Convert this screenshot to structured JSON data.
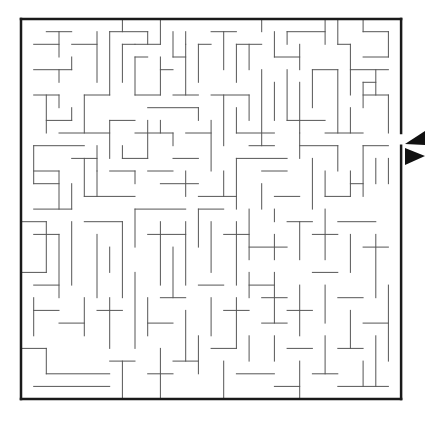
{
  "puzzle": {
    "type": "maze",
    "title": "Maze puzzle",
    "grid": {
      "cols": 30,
      "rows": 30,
      "origin_x": 21,
      "origin_y": 19,
      "cell": 12.67
    },
    "colors": {
      "wall": "#555555",
      "border": "#1a1a1a",
      "background": "#ffffff",
      "arrow": "#111111"
    },
    "entrance": {
      "side": "right",
      "row": 9,
      "label": "Entrance"
    },
    "arrow": {
      "direction": "left",
      "x": 404,
      "y": 131,
      "label": "Start here"
    },
    "border_segments": [
      [
        0,
        0,
        30,
        0
      ],
      [
        0,
        0,
        0,
        30
      ],
      [
        0,
        30,
        30,
        30
      ],
      [
        30,
        0,
        30,
        9
      ],
      [
        30,
        10,
        30,
        30
      ]
    ],
    "walls": [
      [
        8,
        0,
        8,
        1
      ],
      [
        19,
        0,
        19,
        1
      ],
      [
        27,
        0,
        27,
        1
      ],
      [
        25,
        0,
        25,
        2
      ],
      [
        24,
        0,
        24,
        2
      ],
      [
        2,
        1,
        4,
        1
      ],
      [
        1,
        2,
        3,
        2
      ],
      [
        3,
        1,
        3,
        3
      ],
      [
        1,
        4,
        4,
        4
      ],
      [
        4,
        3,
        4,
        4
      ],
      [
        3,
        4,
        3,
        5
      ],
      [
        6,
        1,
        6,
        5
      ],
      [
        4,
        2,
        6,
        2
      ],
      [
        7,
        1,
        7,
        6
      ],
      [
        7,
        1,
        10,
        1
      ],
      [
        10,
        1,
        10,
        2
      ],
      [
        9,
        2,
        11,
        2
      ],
      [
        11,
        0,
        11,
        2
      ],
      [
        8,
        2,
        8,
        5
      ],
      [
        8,
        2,
        9,
        2
      ],
      [
        9,
        3,
        10,
        3
      ],
      [
        9,
        3,
        9,
        6
      ],
      [
        9,
        6,
        11,
        6
      ],
      [
        12,
        1,
        12,
        3
      ],
      [
        12,
        3,
        13,
        3
      ],
      [
        13,
        1,
        13,
        2
      ],
      [
        11,
        3,
        11,
        6
      ],
      [
        11,
        4,
        12,
        4
      ],
      [
        13,
        2,
        13,
        6
      ],
      [
        12,
        6,
        14,
        6
      ],
      [
        14,
        2,
        14,
        5
      ],
      [
        14,
        2,
        15,
        2
      ],
      [
        15,
        1,
        17,
        1
      ],
      [
        16,
        1,
        16,
        4
      ],
      [
        17,
        2,
        19,
        2
      ],
      [
        17,
        2,
        17,
        5
      ],
      [
        18,
        2,
        18,
        4
      ],
      [
        20,
        1,
        20,
        3
      ],
      [
        20,
        3,
        22,
        3
      ],
      [
        22,
        2,
        22,
        4
      ],
      [
        21,
        1,
        24,
        1
      ],
      [
        21,
        1,
        21,
        2
      ],
      [
        25,
        2,
        26,
        2
      ],
      [
        26,
        2,
        26,
        6
      ],
      [
        27,
        1,
        29,
        1
      ],
      [
        29,
        1,
        29,
        3
      ],
      [
        27,
        3,
        29,
        3
      ],
      [
        26,
        4,
        29,
        4
      ],
      [
        28,
        4,
        28,
        6
      ],
      [
        27,
        5,
        28,
        5
      ],
      [
        27,
        5,
        27,
        7
      ],
      [
        27,
        6,
        29,
        6
      ],
      [
        29,
        6,
        29,
        9
      ],
      [
        1,
        6,
        3,
        6
      ],
      [
        3,
        6,
        3,
        7
      ],
      [
        2,
        6,
        2,
        9
      ],
      [
        2,
        8,
        4,
        8
      ],
      [
        4,
        7,
        4,
        8
      ],
      [
        5,
        6,
        5,
        9
      ],
      [
        5,
        6,
        7,
        6
      ],
      [
        3,
        9,
        7,
        9
      ],
      [
        1,
        10,
        5,
        10
      ],
      [
        1,
        10,
        1,
        13
      ],
      [
        1,
        12,
        3,
        12
      ],
      [
        3,
        12,
        3,
        15
      ],
      [
        4,
        11,
        6,
        11
      ],
      [
        5,
        11,
        5,
        14
      ],
      [
        6,
        10,
        6,
        12
      ],
      [
        7,
        8,
        7,
        11
      ],
      [
        7,
        8,
        9,
        8
      ],
      [
        8,
        10,
        8,
        11
      ],
      [
        8,
        11,
        10,
        11
      ],
      [
        10,
        8,
        10,
        11
      ],
      [
        9,
        9,
        12,
        9
      ],
      [
        12,
        9,
        12,
        10
      ],
      [
        10,
        7,
        14,
        7
      ],
      [
        14,
        7,
        14,
        8
      ],
      [
        11,
        8,
        11,
        9
      ],
      [
        13,
        9,
        15,
        9
      ],
      [
        15,
        8,
        15,
        12
      ],
      [
        16,
        6,
        16,
        10
      ],
      [
        15,
        6,
        18,
        6
      ],
      [
        18,
        6,
        18,
        8
      ],
      [
        17,
        7,
        17,
        9
      ],
      [
        17,
        9,
        20,
        9
      ],
      [
        18,
        10,
        20,
        10
      ],
      [
        19,
        4,
        19,
        10
      ],
      [
        20,
        5,
        20,
        8
      ],
      [
        21,
        4,
        21,
        8
      ],
      [
        22,
        5,
        22,
        9
      ],
      [
        21,
        8,
        24,
        8
      ],
      [
        23,
        4,
        23,
        7
      ],
      [
        23,
        4,
        25,
        4
      ],
      [
        25,
        4,
        25,
        9
      ],
      [
        24,
        9,
        27,
        9
      ],
      [
        26,
        7,
        26,
        9
      ],
      [
        22,
        9,
        22,
        11
      ],
      [
        22,
        10,
        25,
        10
      ],
      [
        25,
        10,
        25,
        12
      ],
      [
        27,
        10,
        29,
        10
      ],
      [
        27,
        10,
        27,
        14
      ],
      [
        28,
        11,
        28,
        13
      ],
      [
        29,
        11,
        29,
        13
      ],
      [
        23,
        11,
        23,
        15
      ],
      [
        24,
        12,
        24,
        14
      ],
      [
        24,
        14,
        26,
        14
      ],
      [
        26,
        12,
        26,
        14
      ],
      [
        26,
        13,
        27,
        13
      ],
      [
        1,
        13,
        3,
        13
      ],
      [
        1,
        15,
        4,
        15
      ],
      [
        4,
        13,
        4,
        15
      ],
      [
        5,
        14,
        9,
        14
      ],
      [
        6,
        12,
        6,
        14
      ],
      [
        7,
        12,
        9,
        12
      ],
      [
        9,
        12,
        9,
        13
      ],
      [
        10,
        12,
        12,
        12
      ],
      [
        12,
        11,
        14,
        11
      ],
      [
        11,
        13,
        14,
        13
      ],
      [
        13,
        12,
        13,
        14
      ],
      [
        14,
        14,
        17,
        14
      ],
      [
        16,
        12,
        16,
        14
      ],
      [
        17,
        11,
        17,
        15
      ],
      [
        17,
        11,
        21,
        11
      ],
      [
        19,
        12,
        21,
        12
      ],
      [
        19,
        13,
        19,
        15
      ],
      [
        20,
        14,
        22,
        14
      ],
      [
        20,
        15,
        20,
        16
      ],
      [
        0,
        16,
        2,
        16
      ],
      [
        2,
        16,
        2,
        20
      ],
      [
        1,
        17,
        3,
        17
      ],
      [
        3,
        17,
        3,
        22
      ],
      [
        4,
        16,
        4,
        21
      ],
      [
        5,
        16,
        8,
        16
      ],
      [
        8,
        16,
        8,
        22
      ],
      [
        6,
        17,
        6,
        22
      ],
      [
        7,
        18,
        7,
        20
      ],
      [
        9,
        15,
        9,
        18
      ],
      [
        9,
        15,
        13,
        15
      ],
      [
        10,
        17,
        13,
        17
      ],
      [
        11,
        16,
        11,
        21
      ],
      [
        12,
        18,
        12,
        22
      ],
      [
        13,
        16,
        13,
        21
      ],
      [
        14,
        15,
        14,
        18
      ],
      [
        14,
        15,
        16,
        15
      ],
      [
        15,
        16,
        15,
        20
      ],
      [
        16,
        17,
        18,
        17
      ],
      [
        17,
        16,
        17,
        21
      ],
      [
        18,
        15,
        18,
        19
      ],
      [
        18,
        18,
        21,
        18
      ],
      [
        20,
        17,
        20,
        19
      ],
      [
        21,
        16,
        23,
        16
      ],
      [
        22,
        16,
        22,
        19
      ],
      [
        23,
        17,
        25,
        17
      ],
      [
        24,
        15,
        24,
        19
      ],
      [
        25,
        16,
        28,
        16
      ],
      [
        26,
        17,
        26,
        20
      ],
      [
        27,
        18,
        29,
        18
      ],
      [
        28,
        17,
        28,
        22
      ],
      [
        0,
        20,
        2,
        20
      ],
      [
        1,
        21,
        3,
        21
      ],
      [
        1,
        22,
        1,
        25
      ],
      [
        1,
        23,
        3,
        23
      ],
      [
        3,
        24,
        5,
        24
      ],
      [
        5,
        22,
        5,
        25
      ],
      [
        6,
        23,
        8,
        23
      ],
      [
        7,
        22,
        7,
        26
      ],
      [
        9,
        20,
        9,
        26
      ],
      [
        10,
        22,
        10,
        25
      ],
      [
        10,
        24,
        12,
        24
      ],
      [
        11,
        22,
        13,
        22
      ],
      [
        13,
        23,
        13,
        27
      ],
      [
        14,
        21,
        16,
        21
      ],
      [
        15,
        22,
        15,
        25
      ],
      [
        16,
        23,
        18,
        23
      ],
      [
        17,
        22,
        17,
        26
      ],
      [
        18,
        20,
        18,
        22
      ],
      [
        18,
        21,
        20,
        21
      ],
      [
        19,
        22,
        21,
        22
      ],
      [
        20,
        20,
        20,
        24
      ],
      [
        21,
        23,
        23,
        23
      ],
      [
        22,
        21,
        22,
        25
      ],
      [
        23,
        20,
        25,
        20
      ],
      [
        24,
        21,
        24,
        24
      ],
      [
        25,
        22,
        27,
        22
      ],
      [
        26,
        23,
        26,
        26
      ],
      [
        27,
        24,
        29,
        24
      ],
      [
        29,
        21,
        29,
        27
      ],
      [
        0,
        26,
        2,
        26
      ],
      [
        2,
        26,
        2,
        28
      ],
      [
        2,
        28,
        7,
        28
      ],
      [
        1,
        29,
        7,
        29
      ],
      [
        7,
        27,
        9,
        27
      ],
      [
        8,
        27,
        8,
        30
      ],
      [
        10,
        28,
        12,
        28
      ],
      [
        11,
        26,
        11,
        30
      ],
      [
        12,
        27,
        14,
        27
      ],
      [
        14,
        25,
        14,
        28
      ],
      [
        15,
        26,
        17,
        26
      ],
      [
        16,
        27,
        16,
        30
      ],
      [
        17,
        28,
        20,
        28
      ],
      [
        18,
        25,
        18,
        27
      ],
      [
        19,
        24,
        21,
        24
      ],
      [
        20,
        25,
        20,
        27
      ],
      [
        21,
        26,
        23,
        26
      ],
      [
        22,
        27,
        22,
        30
      ],
      [
        23,
        28,
        25,
        28
      ],
      [
        24,
        25,
        24,
        28
      ],
      [
        25,
        26,
        27,
        26
      ],
      [
        27,
        27,
        27,
        29
      ],
      [
        28,
        25,
        28,
        29
      ],
      [
        25,
        29,
        29,
        29
      ],
      [
        20,
        29,
        22,
        29
      ]
    ]
  }
}
